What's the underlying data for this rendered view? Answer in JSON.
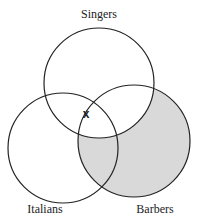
{
  "diagram": {
    "type": "venn",
    "sets": [
      {
        "name": "Singers",
        "cx": 99,
        "cy": 83,
        "r": 55
      },
      {
        "name": "Italians",
        "cx": 63,
        "cy": 148,
        "r": 55
      },
      {
        "name": "Barbers",
        "cx": 134,
        "cy": 141,
        "r": 56
      }
    ],
    "labels": {
      "singers": "Singers",
      "italians": "Italians",
      "barbers": "Barbers"
    },
    "mark": {
      "text": "x",
      "region": "Singers ∩ Italians, outside Barbers (on boundary)"
    },
    "shaded_region": "Barbers minus Singers",
    "colors": {
      "stroke": "#222222",
      "shade": "#d9d9d9",
      "background": "#ffffff"
    }
  }
}
